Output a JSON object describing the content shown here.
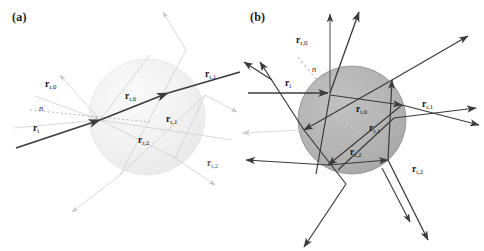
{
  "figure": {
    "background_color": "#ffffff",
    "width": 484,
    "height": 251
  },
  "panels": [
    {
      "id": "a",
      "label": "(a)",
      "description": "Weakly refracting sphere: incident ray passes nearly straight through",
      "sphere": {
        "cx": 147,
        "cy": 117,
        "r": 58,
        "fill": "#f1f1f1",
        "stroke": "#e2e2e2"
      },
      "ray_color_primary": "#3b3b3b",
      "ray_color_faint": "#c9c9c9",
      "normal_color": "#b5b5b5",
      "labels": {
        "incident": "r",
        "incident_sub": "i",
        "reflected0": "r",
        "reflected0_sub": "r,0",
        "transmitted0": "r",
        "transmitted0_sub": "t,0",
        "transmitted1": "r",
        "transmitted1_sub": "t,1",
        "internal1": "r",
        "internal1_sub": "r,1",
        "internal2": "r",
        "internal2_sub": "r,2",
        "transmitted2": "r",
        "transmitted2_sub": "t,2",
        "normal": "n"
      }
    },
    {
      "id": "b",
      "label": "(b)",
      "description": "Strongly refracting sphere: multiple internal reflections and exit rays",
      "sphere": {
        "cx": 110,
        "cy": 120,
        "r": 54,
        "fill": "#b4b4b4",
        "stroke": "#8f8f8f"
      },
      "ray_color_primary": "#3a3a3a",
      "ray_color_faint": "#d8d8d8",
      "normal_color": "#bdbdbd",
      "labels": {
        "incident": "r",
        "incident_sub": "i",
        "reflected0": "r",
        "reflected0_sub": "r,0",
        "transmitted0": "r",
        "transmitted0_sub": "t,0",
        "transmitted1": "r",
        "transmitted1_sub": "t,1",
        "internal1": "r",
        "internal1_sub": "r,1",
        "internal2": "r",
        "internal2_sub": "r,2",
        "transmitted2": "r",
        "transmitted2_sub": "t,2",
        "normal": "n"
      }
    }
  ],
  "ray_notation": {
    "incident_symbol": "r_i",
    "reflected_symbol": "r_r,k",
    "transmitted_symbol": "r_t,k",
    "normal_symbol": "n"
  }
}
